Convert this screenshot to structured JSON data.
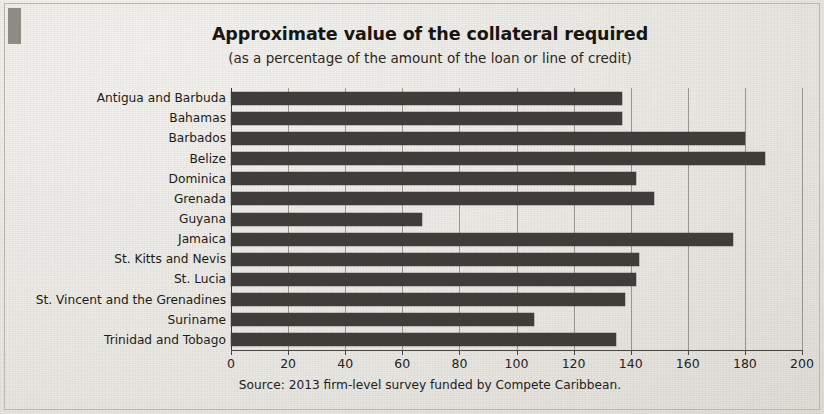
{
  "chart_data": {
    "type": "bar",
    "orientation": "horizontal",
    "title": "Approximate value of the collateral required",
    "subtitle": "(as a percentage of the amount of the loan or line of credit)",
    "source": "Source: 2013 firm-level survey funded by Compete Caribbean.",
    "xlabel": "",
    "ylabel": "",
    "xlim": [
      0,
      200
    ],
    "xticks": [
      0,
      20,
      40,
      60,
      80,
      100,
      120,
      140,
      160,
      180,
      200
    ],
    "xtick_labels": [
      "0",
      "20",
      "40",
      "60",
      "80",
      "100",
      "120",
      "140",
      "160",
      "180",
      "200"
    ],
    "grid": true,
    "legend": false,
    "bar_color": "#3f3d39",
    "background_color": "#eceae6",
    "categories": [
      "Antigua and Barbuda",
      "Bahamas",
      "Barbados",
      "Belize",
      "Dominica",
      "Grenada",
      "Guyana",
      "Jamaica",
      "St. Kitts and Nevis",
      "St. Lucia",
      "St. Vincent and the Grenadines",
      "Suriname",
      "Trinidad and Tobago"
    ],
    "values": [
      137,
      137,
      180,
      187,
      142,
      148,
      67,
      176,
      143,
      142,
      138,
      106,
      135
    ]
  }
}
